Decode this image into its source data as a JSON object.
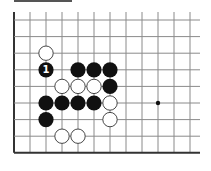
{
  "diagram": {
    "type": "go-board-fragment",
    "grid": {
      "origin_x": 14,
      "origin_y": 20,
      "spacing_x": 16,
      "spacing_y": 16.6,
      "cols": 12,
      "rows": 9,
      "right_edge_x": 200,
      "edges": {
        "left": true,
        "bottom": true,
        "top": false,
        "right": false
      }
    },
    "colors": {
      "line": "#8a8a8a",
      "edge": "#333333",
      "black_stone": "#111111",
      "white_stone": "#ffffff",
      "white_stone_border": "#333333",
      "label_on_black": "#ffffff"
    },
    "star_points": [
      {
        "col": 9,
        "row": 5
      }
    ],
    "stones": [
      {
        "col": 2,
        "row": 2,
        "color": "white"
      },
      {
        "col": 2,
        "row": 3,
        "color": "black",
        "label": "1"
      },
      {
        "col": 4,
        "row": 3,
        "color": "black"
      },
      {
        "col": 5,
        "row": 3,
        "color": "black"
      },
      {
        "col": 6,
        "row": 3,
        "color": "black"
      },
      {
        "col": 3,
        "row": 4,
        "color": "white"
      },
      {
        "col": 4,
        "row": 4,
        "color": "white"
      },
      {
        "col": 5,
        "row": 4,
        "color": "white"
      },
      {
        "col": 6,
        "row": 4,
        "color": "black"
      },
      {
        "col": 2,
        "row": 5,
        "color": "black"
      },
      {
        "col": 3,
        "row": 5,
        "color": "black"
      },
      {
        "col": 4,
        "row": 5,
        "color": "black"
      },
      {
        "col": 5,
        "row": 5,
        "color": "black"
      },
      {
        "col": 6,
        "row": 5,
        "color": "white"
      },
      {
        "col": 2,
        "row": 6,
        "color": "black"
      },
      {
        "col": 6,
        "row": 6,
        "color": "white"
      },
      {
        "col": 3,
        "row": 7,
        "color": "white"
      },
      {
        "col": 4,
        "row": 7,
        "color": "white"
      }
    ]
  }
}
